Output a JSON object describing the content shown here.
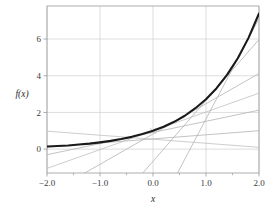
{
  "chart_data": {
    "type": "line",
    "title": "",
    "xlabel": "x",
    "ylabel": "f(x)",
    "xlim": [
      -2.0,
      2.0
    ],
    "ylim": [
      -1.3,
      7.8
    ],
    "xticks": [
      -2.0,
      -1.0,
      0.0,
      1.0,
      2.0
    ],
    "xtick_labels": [
      "−2.0",
      "−1.0",
      "0.0",
      "1.0",
      "2.0"
    ],
    "yticks": [
      0,
      2,
      4,
      6
    ],
    "ytick_labels": [
      "0",
      "2",
      "4",
      "6"
    ],
    "grid": true,
    "grid_color": "#c8c8c8",
    "frame_color": "#9a9a9a",
    "series": [
      {
        "name": "f(x)",
        "role": "main-curve",
        "color": "#1a1a1a",
        "width": 2.1,
        "x": [
          -2.0,
          -1.8,
          -1.6,
          -1.4,
          -1.2,
          -1.0,
          -0.8,
          -0.6,
          -0.4,
          -0.2,
          0.0,
          0.2,
          0.4,
          0.6,
          0.8,
          1.0,
          1.2,
          1.4,
          1.6,
          1.8,
          2.0
        ],
        "values": [
          0.14,
          0.17,
          0.2,
          0.25,
          0.3,
          0.37,
          0.45,
          0.55,
          0.67,
          0.82,
          1.0,
          1.22,
          1.49,
          1.82,
          2.23,
          2.72,
          3.32,
          4.06,
          4.95,
          6.05,
          7.39
        ]
      },
      {
        "name": "tangent at x = -1.5",
        "role": "tangent-line",
        "color": "#b4b4b4",
        "width": 0.8,
        "tangent_point": -1.5,
        "slope": 0.223,
        "intercept": 0.558,
        "x": [
          -2.0,
          2.0
        ],
        "values": [
          0.112,
          1.004
        ]
      },
      {
        "name": "tangent at x = -0.5",
        "role": "tangent-line",
        "color": "#b4b4b4",
        "width": 0.8,
        "tangent_point": -0.5,
        "slope": 0.607,
        "intercept": 0.91,
        "x": [
          -2.0,
          2.0
        ],
        "values": [
          -0.304,
          2.124
        ]
      },
      {
        "name": "tangent at x = 0.5",
        "role": "tangent-line",
        "color": "#b4b4b4",
        "width": 0.8,
        "tangent_point": 0.5,
        "slope": 1.649,
        "intercept": 0.824,
        "x": [
          -2.0,
          2.0
        ],
        "values": [
          -2.474,
          4.122
        ]
      },
      {
        "name": "tangent at x = 1.2",
        "role": "tangent-line",
        "color": "#b4b4b4",
        "width": 0.8,
        "tangent_point": 1.2,
        "slope": 3.32,
        "intercept": -0.664,
        "x": [
          -2.0,
          2.0
        ],
        "values": [
          -7.304,
          5.976
        ]
      },
      {
        "name": "tangent at x = 1.7",
        "role": "tangent-line",
        "color": "#b4b4b4",
        "width": 0.8,
        "tangent_point": 1.7,
        "slope": 5.474,
        "intercept": -3.832,
        "x": [
          -2.0,
          2.0
        ],
        "values": [
          -14.78,
          7.116
        ]
      },
      {
        "name": "secant low",
        "role": "secant-line",
        "color": "#c0c0c0",
        "width": 0.8,
        "x": [
          -2.0,
          2.0
        ],
        "values": [
          -1.05,
          3.05
        ]
      },
      {
        "name": "secant high",
        "role": "secant-line",
        "color": "#c0c0c0",
        "width": 0.8,
        "x": [
          -2.0,
          2.0
        ],
        "values": [
          0.98,
          0.1
        ]
      }
    ],
    "markers": [
      {
        "name": "tangency-marker",
        "x": 0.0,
        "y": 1.0,
        "symbol": "x",
        "color": "#bdbdbd"
      }
    ]
  },
  "axes": {
    "x_title": "x",
    "y_title": "f(x)"
  }
}
